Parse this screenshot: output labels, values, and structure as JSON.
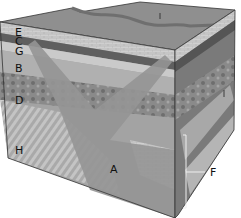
{
  "diagram": {
    "type": "geologic-block-diagram",
    "labels": {
      "E": "E",
      "C": "C",
      "G": "G",
      "B": "B",
      "D": "D",
      "H": "H",
      "A": "A",
      "F": "F",
      "I_top": "I",
      "I_side": "I"
    },
    "colors": {
      "top_surface": "#8c8c8c",
      "sandstone": "#c8c8c8",
      "dark_band": "#6a6a6a",
      "shale": "#a0a0a0",
      "conglomerate": "#7e7e7e",
      "intrusion": "#9a9a9a",
      "striped_bed": "#bdbdbd",
      "outline": "#333333"
    }
  }
}
